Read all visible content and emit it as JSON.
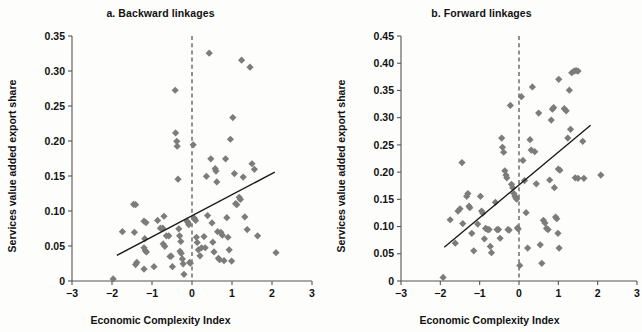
{
  "figure": {
    "background_color": "#fdfdfc",
    "marker_color": "#7c7c7c",
    "trend_color": "#1a1a1a",
    "axis_color": "#555555"
  },
  "chart_data": [
    {
      "type": "scatter",
      "panel_id": "a",
      "title": "a. Backward linkages",
      "xlabel": "Economic Complexity Index",
      "ylabel": "Services value added export share",
      "xlim": [
        -3,
        3
      ],
      "ylim": [
        0,
        0.35
      ],
      "xticks": [
        -3,
        -2,
        -1,
        0,
        1,
        2,
        3
      ],
      "xticklabels": [
        "−3",
        "−2",
        "−1",
        "0",
        "1",
        "2",
        "3"
      ],
      "yticks": [
        0,
        0.05,
        0.1,
        0.15,
        0.2,
        0.25,
        0.3,
        0.35
      ],
      "yticklabels": [
        "0",
        "0.05",
        "0.10",
        "0.15",
        "0.20",
        "0.25",
        "0.30",
        "0.35"
      ],
      "grid": false,
      "legend": "none",
      "reference_line": {
        "orientation": "vertical",
        "x": 0,
        "style": "dashed"
      },
      "trendline": {
        "x0": -1.88,
        "y0": 0.0365,
        "x1": 2.07,
        "y1": 0.1555
      },
      "points": [
        [
          -1.97,
          0.003
        ],
        [
          -1.74,
          0.0705
        ],
        [
          -1.46,
          0.1095
        ],
        [
          -1.41,
          0.109
        ],
        [
          -1.44,
          0.0695
        ],
        [
          -1.38,
          0.0265
        ],
        [
          -1.41,
          0.0235
        ],
        [
          -1.2,
          0.0855
        ],
        [
          -1.15,
          0.0835
        ],
        [
          -1.18,
          0.0605
        ],
        [
          -1.2,
          0.0475
        ],
        [
          -1.17,
          0.0435
        ],
        [
          -1.14,
          0.0415
        ],
        [
          -1.2,
          0.017
        ],
        [
          -0.95,
          0.0205
        ],
        [
          -0.86,
          0.0865
        ],
        [
          -0.79,
          0.0755
        ],
        [
          -0.73,
          0.0755
        ],
        [
          -0.7,
          0.0925
        ],
        [
          -0.72,
          0.053
        ],
        [
          -0.68,
          0.0495
        ],
        [
          -0.64,
          0.0645
        ],
        [
          -0.58,
          0.0645
        ],
        [
          -0.55,
          0.035
        ],
        [
          -0.52,
          0.0355
        ],
        [
          -0.49,
          0.0205
        ],
        [
          -0.41,
          0.2115
        ],
        [
          -0.38,
          0.1995
        ],
        [
          -0.37,
          0.1925
        ],
        [
          -0.35,
          0.1455
        ],
        [
          -0.33,
          0.0745
        ],
        [
          -0.31,
          0.0645
        ],
        [
          -0.28,
          0.0565
        ],
        [
          -0.3,
          0.0425
        ],
        [
          -0.27,
          0.0395
        ],
        [
          -0.24,
          0.0315
        ],
        [
          -0.22,
          0.0245
        ],
        [
          -0.2,
          0.0095
        ],
        [
          -0.42,
          0.2725
        ],
        [
          -0.12,
          0.0855
        ],
        [
          -0.1,
          0.0835
        ],
        [
          -0.08,
          0.0805
        ],
        [
          -0.06,
          0.0265
        ],
        [
          -0.04,
          0.0255
        ],
        [
          0.03,
          0.1945
        ],
        [
          0.06,
          0.0895
        ],
        [
          0.09,
          0.0865
        ],
        [
          0.11,
          0.0625
        ],
        [
          0.13,
          0.055
        ],
        [
          0.16,
          0.0445
        ],
        [
          0.2,
          0.036
        ],
        [
          0.24,
          0.0475
        ],
        [
          0.3,
          0.0635
        ],
        [
          0.33,
          0.0475
        ],
        [
          0.36,
          0.1495
        ],
        [
          0.39,
          0.0935
        ],
        [
          0.43,
          0.3255
        ],
        [
          0.47,
          0.1745
        ],
        [
          0.5,
          0.083
        ],
        [
          0.52,
          0.0555
        ],
        [
          0.55,
          0.0415
        ],
        [
          0.58,
          0.1605
        ],
        [
          0.6,
          0.157
        ],
        [
          0.62,
          0.1415
        ],
        [
          0.64,
          0.0705
        ],
        [
          0.66,
          0.0325
        ],
        [
          0.69,
          0.0305
        ],
        [
          0.72,
          0.0695
        ],
        [
          0.76,
          0.0655
        ],
        [
          0.8,
          0.029
        ],
        [
          0.84,
          0.1745
        ],
        [
          0.87,
          0.0905
        ],
        [
          0.9,
          0.0625
        ],
        [
          0.93,
          0.0445
        ],
        [
          0.96,
          0.2025
        ],
        [
          0.99,
          0.0285
        ],
        [
          1.02,
          0.2335
        ],
        [
          1.06,
          0.1535
        ],
        [
          1.09,
          0.1105
        ],
        [
          1.12,
          0.109
        ],
        [
          1.18,
          0.1195
        ],
        [
          1.21,
          0.1165
        ],
        [
          1.24,
          0.3155
        ],
        [
          1.28,
          0.1485
        ],
        [
          1.32,
          0.0915
        ],
        [
          1.38,
          0.0735
        ],
        [
          1.45,
          0.3055
        ],
        [
          1.5,
          0.1675
        ],
        [
          1.56,
          0.1595
        ],
        [
          1.64,
          0.0645
        ],
        [
          2.1,
          0.0405
        ]
      ]
    },
    {
      "type": "scatter",
      "panel_id": "b",
      "title": "b. Forward linkages",
      "xlabel": "Economic Complexity Index",
      "ylabel": "Services value added export share",
      "xlim": [
        -3,
        3
      ],
      "ylim": [
        0,
        0.45
      ],
      "xticks": [
        -3,
        -2,
        -1,
        0,
        1,
        2,
        3
      ],
      "xticklabels": [
        "−3",
        "−2",
        "−1",
        "0",
        "1",
        "2",
        "3"
      ],
      "yticks": [
        0,
        0.05,
        0.1,
        0.15,
        0.2,
        0.25,
        0.3,
        0.35,
        0.4,
        0.45
      ],
      "yticklabels": [
        "0",
        "0.05",
        "0.10",
        "0.15",
        "0.20",
        "0.25",
        "0.30",
        "0.35",
        "0.40",
        "0.45"
      ],
      "grid": false,
      "legend": "none",
      "reference_line": {
        "orientation": "vertical",
        "x": 0,
        "style": "dashed"
      },
      "trendline": {
        "x0": -1.9,
        "y0": 0.062,
        "x1": 1.82,
        "y1": 0.286
      },
      "points": [
        [
          -1.93,
          0.0065
        ],
        [
          -1.75,
          0.1125
        ],
        [
          -1.62,
          0.0695
        ],
        [
          -1.55,
          0.1285
        ],
        [
          -1.5,
          0.1325
        ],
        [
          -1.45,
          0.2175
        ],
        [
          -1.43,
          0.1055
        ],
        [
          -1.33,
          0.1555
        ],
        [
          -1.3,
          0.1605
        ],
        [
          -1.27,
          0.1375
        ],
        [
          -1.25,
          0.1345
        ],
        [
          -1.2,
          0.0875
        ],
        [
          -1.15,
          0.0555
        ],
        [
          -1.05,
          0.1045
        ],
        [
          -0.98,
          0.1555
        ],
        [
          -0.95,
          0.1285
        ],
        [
          -0.92,
          0.1245
        ],
        [
          -0.88,
          0.0775
        ],
        [
          -0.85,
          0.0965
        ],
        [
          -0.82,
          0.0955
        ],
        [
          -0.79,
          0.0945
        ],
        [
          -0.76,
          0.0945
        ],
        [
          -0.73,
          0.0635
        ],
        [
          -0.7,
          0.052
        ],
        [
          -0.6,
          0.1445
        ],
        [
          -0.56,
          0.0945
        ],
        [
          -0.52,
          0.0945
        ],
        [
          -0.48,
          0.0785
        ],
        [
          -0.44,
          0.2625
        ],
        [
          -0.42,
          0.2455
        ],
        [
          -0.39,
          0.2365
        ],
        [
          -0.36,
          0.2025
        ],
        [
          -0.33,
          0.1945
        ],
        [
          -0.31,
          0.1895
        ],
        [
          -0.28,
          0.0945
        ],
        [
          -0.25,
          0.0935
        ],
        [
          -0.22,
          0.3225
        ],
        [
          -0.19,
          0.1775
        ],
        [
          -0.16,
          0.1715
        ],
        [
          -0.13,
          0.1605
        ],
        [
          -0.1,
          0.1555
        ],
        [
          -0.08,
          0.1525
        ],
        [
          -0.06,
          0.1505
        ],
        [
          -0.04,
          0.0975
        ],
        [
          -0.02,
          0.0955
        ],
        [
          0.02,
          0.0285
        ],
        [
          0.06,
          0.3385
        ],
        [
          0.1,
          0.2215
        ],
        [
          0.14,
          0.1845
        ],
        [
          0.18,
          0.1255
        ],
        [
          0.22,
          0.0605
        ],
        [
          0.28,
          0.2595
        ],
        [
          0.31,
          0.2405
        ],
        [
          0.34,
          0.3565
        ],
        [
          0.4,
          0.2375
        ],
        [
          0.44,
          0.1785
        ],
        [
          0.5,
          0.3085
        ],
        [
          0.54,
          0.0665
        ],
        [
          0.58,
          0.0325
        ],
        [
          0.62,
          0.1115
        ],
        [
          0.66,
          0.1065
        ],
        [
          0.7,
          0.0965
        ],
        [
          0.74,
          0.0945
        ],
        [
          0.78,
          0.1855
        ],
        [
          0.82,
          0.2955
        ],
        [
          0.85,
          0.3155
        ],
        [
          0.88,
          0.3185
        ],
        [
          0.9,
          0.1715
        ],
        [
          0.93,
          0.1175
        ],
        [
          0.96,
          0.1145
        ],
        [
          0.99,
          0.0875
        ],
        [
          1.02,
          0.0605
        ],
        [
          1.0,
          0.2055
        ],
        [
          1.04,
          0.2035
        ],
        [
          1.01,
          0.3705
        ],
        [
          1.15,
          0.3165
        ],
        [
          1.2,
          0.3125
        ],
        [
          1.24,
          0.2625
        ],
        [
          1.28,
          0.3505
        ],
        [
          1.31,
          0.2785
        ],
        [
          1.34,
          0.3825
        ],
        [
          1.4,
          0.3855
        ],
        [
          1.45,
          0.3865
        ],
        [
          1.5,
          0.3855
        ],
        [
          1.43,
          0.1895
        ],
        [
          1.5,
          0.1885
        ],
        [
          1.62,
          0.2565
        ],
        [
          1.65,
          0.1885
        ],
        [
          2.08,
          0.1945
        ]
      ]
    }
  ]
}
